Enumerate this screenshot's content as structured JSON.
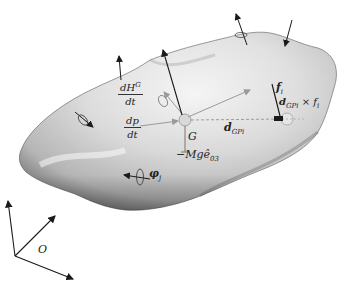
{
  "figure": {
    "type": "rigid-body-free-body-diagram",
    "labels": {
      "dHG_num": "dH",
      "dHG_sup": "G",
      "dHG_den": "dt",
      "dp_num": "dp",
      "dp_den": "dt",
      "G": "G",
      "gravity": "−Mgê",
      "gravity_sub": "03",
      "f_i": "f",
      "f_i_sub": "i",
      "d_GPi": "d",
      "d_GPi_sub": "GPi",
      "torque": "d",
      "torque_sub": "GPi",
      "torque_rest": " × f",
      "torque_rest_sub": "i",
      "phi_j": "φ",
      "phi_j_sub": "j",
      "origin": "O"
    },
    "colors": {
      "body_light": "#f4f4f4",
      "body_mid": "#c8c8c8",
      "body_dark": "#7a7a7a",
      "arrow": "#1a1a1a",
      "arrow_light": "#9a9a9a"
    }
  }
}
